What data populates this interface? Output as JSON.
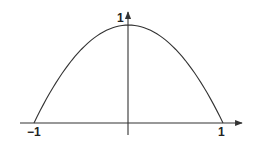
{
  "chart_data": {
    "type": "line",
    "title": "",
    "function": "y = 1 - x^2",
    "xlabel": "",
    "ylabel": "",
    "xlim": [
      -1,
      1
    ],
    "ylim": [
      0,
      1
    ],
    "grid": false,
    "legend": null,
    "x": [
      -1,
      -0.75,
      -0.5,
      -0.25,
      0,
      0.25,
      0.5,
      0.75,
      1
    ],
    "series": [
      {
        "name": "curve",
        "values": [
          0,
          0.4375,
          0.75,
          0.9375,
          1,
          0.9375,
          0.75,
          0.4375,
          0
        ]
      }
    ],
    "tick_labels": {
      "x_left": "−1",
      "x_right": "1",
      "y_top": "1"
    },
    "colors": {
      "curve": "#333333",
      "axes": "#333333"
    }
  }
}
